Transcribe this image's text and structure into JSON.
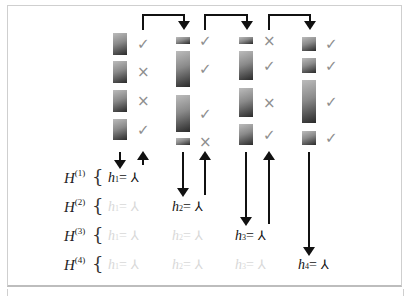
{
  "diagram": {
    "columns": [
      {
        "index": 1,
        "bars": [
          {
            "top": 33,
            "h": 22
          },
          {
            "top": 61,
            "h": 22
          },
          {
            "top": 90,
            "h": 22
          },
          {
            "top": 119,
            "h": 21
          }
        ],
        "marks": [
          "check",
          "cross",
          "cross",
          "check"
        ]
      },
      {
        "index": 2,
        "bars": [
          {
            "top": 37,
            "h": 7
          },
          {
            "top": 51,
            "h": 36
          },
          {
            "top": 95,
            "h": 37
          },
          {
            "top": 138,
            "h": 7
          }
        ],
        "marks": [
          "check",
          "check",
          "check",
          "cross"
        ]
      },
      {
        "index": 3,
        "bars": [
          {
            "top": 37,
            "h": 7
          },
          {
            "top": 51,
            "h": 29
          },
          {
            "top": 88,
            "h": 29
          },
          {
            "top": 124,
            "h": 21
          }
        ],
        "marks": [
          "cross",
          "check",
          "cross",
          "check"
        ]
      },
      {
        "index": 4,
        "bars": [
          {
            "top": 37,
            "h": 14
          },
          {
            "top": 58,
            "h": 15
          },
          {
            "top": 80,
            "h": 43
          },
          {
            "top": 131,
            "h": 14
          }
        ],
        "marks": [
          "check",
          "check",
          "check",
          "check"
        ]
      }
    ],
    "mark_glyphs": {
      "check": "✓",
      "cross": "×"
    },
    "transfer_arrows": [
      {
        "from_col": 1,
        "to_col": 2
      },
      {
        "from_col": 2,
        "to_col": 3
      },
      {
        "from_col": 3,
        "to_col": 4
      }
    ],
    "rows": [
      {
        "label": "H",
        "sup": "(1)",
        "cells": [
          {
            "text": "h",
            "sub": "1",
            "eq": "=",
            "state": "active"
          }
        ]
      },
      {
        "label": "H",
        "sup": "(2)",
        "cells": [
          {
            "text": "h",
            "sub": "1",
            "eq": "=",
            "state": "faded"
          },
          {
            "text": "h",
            "sub": "2",
            "eq": "=",
            "state": "active"
          }
        ]
      },
      {
        "label": "H",
        "sup": "(3)",
        "cells": [
          {
            "text": "h",
            "sub": "1",
            "eq": "=",
            "state": "faded"
          },
          {
            "text": "h",
            "sub": "2",
            "eq": "=",
            "state": "faded"
          },
          {
            "text": "h",
            "sub": "3",
            "eq": "=",
            "state": "active"
          }
        ]
      },
      {
        "label": "H",
        "sup": "(4)",
        "cells": [
          {
            "text": "h",
            "sub": "1",
            "eq": "=",
            "state": "faded"
          },
          {
            "text": "h",
            "sub": "2",
            "eq": "=",
            "state": "faded"
          },
          {
            "text": "h",
            "sub": "3",
            "eq": "=",
            "state": "faded"
          },
          {
            "text": "h",
            "sub": "4",
            "eq": "=",
            "state": "active"
          }
        ]
      }
    ],
    "tree_icon": "⅄",
    "brace": "{"
  }
}
